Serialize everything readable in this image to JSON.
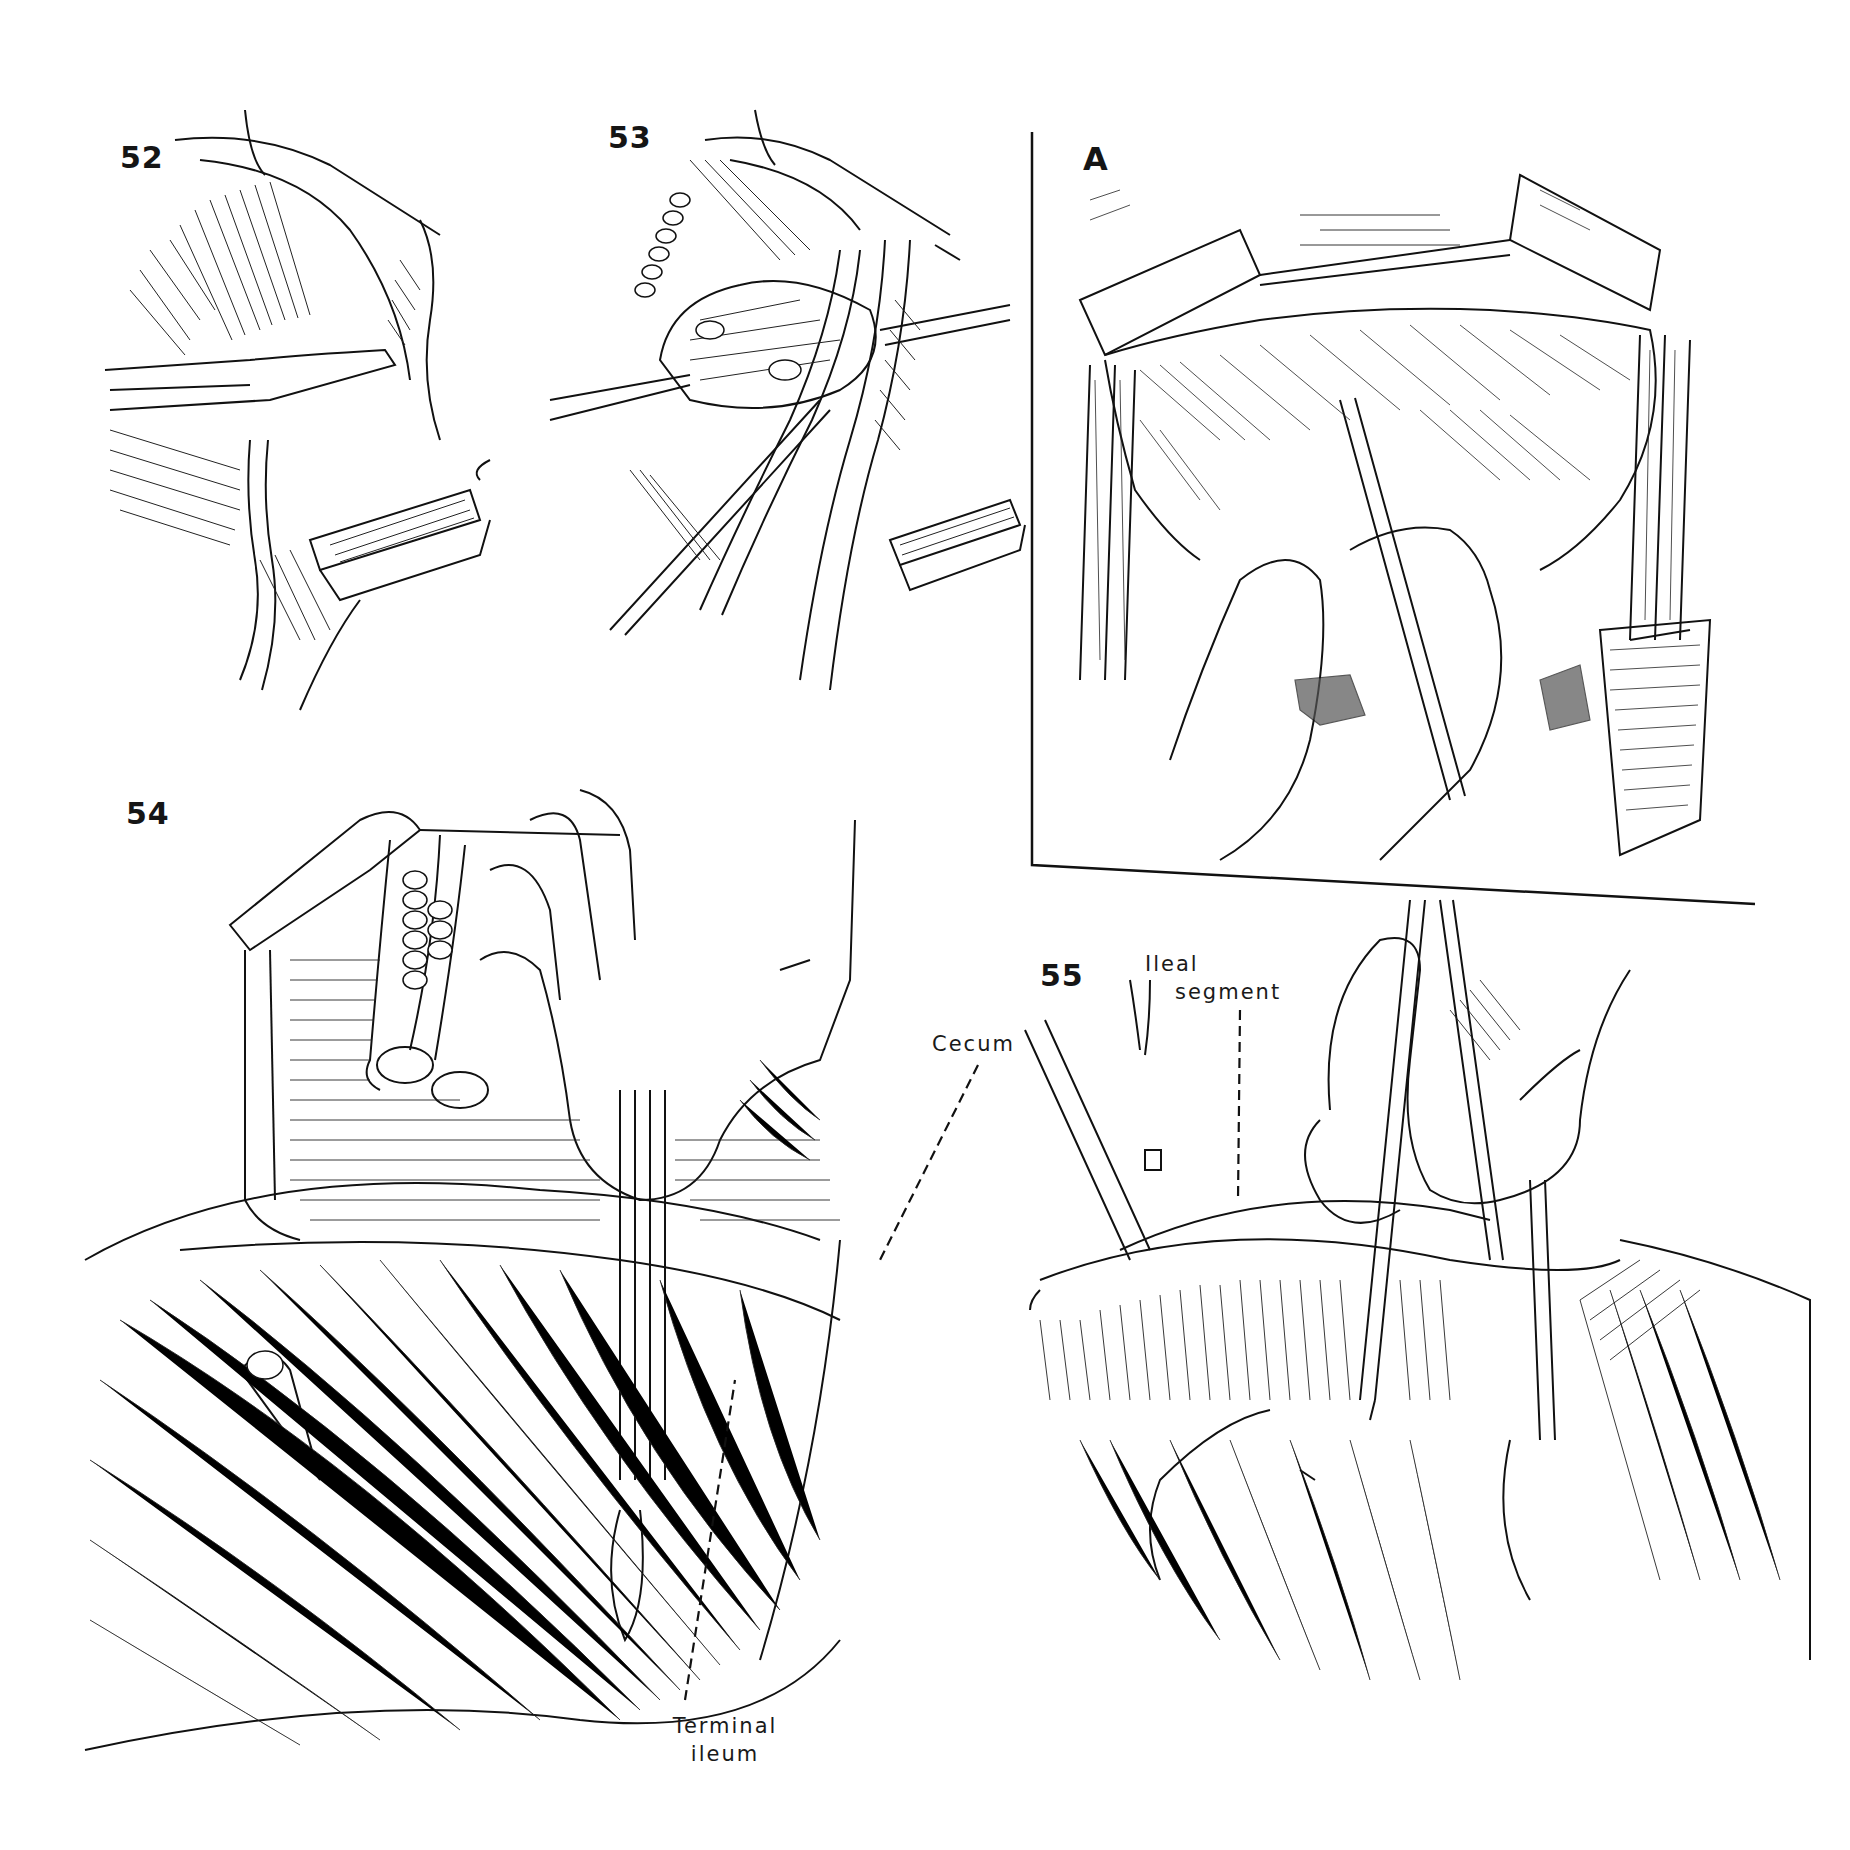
{
  "plate": {
    "description": "Surgical illustration plate, black line drawings on white",
    "colors": {
      "ink": "#111111",
      "paper": "#ffffff"
    }
  },
  "figures": [
    {
      "id": "52",
      "label": "52",
      "subject": "Retractor and forceps lifting tissue beside vessels; ribbon retractor below"
    },
    {
      "id": "53",
      "label": "53",
      "subject": "Node mass elevated with forceps alongside major vessels; ribbon retractor below"
    },
    {
      "id": "A",
      "label": "A",
      "subject": "Inset: open abdomen with bowel mass, hand holding forceps; framed in box"
    },
    {
      "id": "54",
      "label": "54",
      "subject": "Hand with clamps on mesentery near cecum and terminal ileum",
      "annotations": [
        {
          "text": "Cecum",
          "leader": "dashed"
        },
        {
          "text_lines": [
            "Terminal",
            "ileum"
          ],
          "leader": "dashed"
        }
      ]
    },
    {
      "id": "55",
      "label": "55",
      "subject": "Hand applying clamps to divide mesentery of ileal segment",
      "annotations": [
        {
          "text_lines": [
            "Ileal",
            "segment"
          ],
          "leader": "dashed"
        }
      ]
    }
  ],
  "labels": {
    "fig52": "52",
    "fig53": "53",
    "figA": "A",
    "fig54": "54",
    "fig55": "55",
    "cecum": "Cecum",
    "terminal_ileum_line1": "Terminal",
    "terminal_ileum_line2": "ileum",
    "ileal_segment_line1": "Ileal",
    "ileal_segment_line2": "segment"
  }
}
